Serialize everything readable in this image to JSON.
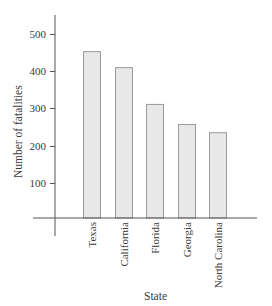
{
  "chart_data": {
    "type": "bar",
    "title": "",
    "xlabel": "State",
    "ylabel": "Number of fatalities",
    "categories": [
      "Texas",
      "California",
      "Florida",
      "Georgia",
      "North Carolina"
    ],
    "values": [
      454,
      411,
      312,
      258,
      236
    ],
    "yticks": [
      100,
      200,
      300,
      400,
      500
    ],
    "ytick_labels": [
      "100",
      "200",
      "300",
      "400",
      "500"
    ],
    "ylim": [
      0,
      550
    ],
    "grid": false,
    "legend": null,
    "bar_fill": "#e8e8e8",
    "bar_stroke": "#9a9a9a",
    "axis_color": "#555555"
  }
}
